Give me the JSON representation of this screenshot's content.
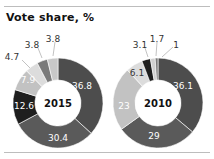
{
  "title": "Vote share, %",
  "charts": [
    {
      "label": "2015",
      "cx": 58,
      "cy": 103,
      "r_outer": 45,
      "r_inner": 23,
      "segments": [
        {
          "value": 36.8,
          "color": "#4d4d4d",
          "label": "36.8",
          "label_pos": [
            82,
            86
          ],
          "label_color": "#ffffff"
        },
        {
          "value": 30.4,
          "color": "#5a5a5a",
          "label": "30.4",
          "label_pos": [
            58,
            138
          ],
          "label_color": "#ffffff"
        },
        {
          "value": 12.6,
          "color": "#1e1e1e",
          "label": "12.6",
          "label_pos": [
            24,
            106
          ],
          "label_color": "#ffffff"
        },
        {
          "value": 7.9,
          "color": "#c2c2c2",
          "label": "7.9",
          "label_pos": [
            28,
            80
          ],
          "label_color": "#ffffff"
        },
        {
          "value": 4.7,
          "color": "#dcdcdc",
          "label": "4.7",
          "label_pos": [
            12,
            57
          ],
          "label_color": "#333333",
          "leader": [
            22,
            60,
            30,
            68
          ]
        },
        {
          "value": 3.8,
          "color": "#7a7a7a",
          "label": "3.8",
          "label_pos": [
            32,
            45
          ],
          "label_color": "#333333",
          "leader": [
            38,
            48,
            42,
            58
          ]
        },
        {
          "value": 3.8,
          "color": "#c8c8c8",
          "label": "3.8",
          "label_pos": [
            53,
            39
          ],
          "label_color": "#333333",
          "leader": [
            55,
            42,
            53,
            56
          ]
        }
      ]
    },
    {
      "label": "2010",
      "cx": 158,
      "cy": 103,
      "r_outer": 45,
      "r_inner": 23,
      "segments": [
        {
          "value": 36.1,
          "color": "#4d4d4d",
          "label": "36.1",
          "label_pos": [
            183,
            86
          ],
          "label_color": "#ffffff"
        },
        {
          "value": 29,
          "color": "#5a5a5a",
          "label": "29",
          "label_pos": [
            154,
            136
          ],
          "label_color": "#ffffff"
        },
        {
          "value": 23,
          "color": "#c2c2c2",
          "label": "23",
          "label_pos": [
            124,
            106
          ],
          "label_color": "#ffffff"
        },
        {
          "value": 6.1,
          "color": "#dcdcdc",
          "label": "6.1",
          "label_pos": [
            137,
            73
          ],
          "label_color": "#333333"
        },
        {
          "value": 3.1,
          "color": "#1e1e1e",
          "label": "3.1",
          "label_pos": [
            140,
            45
          ],
          "label_color": "#333333",
          "leader": [
            145,
            48,
            148,
            57
          ]
        },
        {
          "value": 1.7,
          "color": "#d0d0d0",
          "label": "1.7",
          "label_pos": [
            157,
            39
          ],
          "label_color": "#333333",
          "leader": [
            157,
            42,
            156,
            56
          ]
        },
        {
          "value": 1,
          "color": "#7a7a7a",
          "label": "1",
          "label_pos": [
            176,
            45
          ],
          "label_color": "#333333",
          "leader": [
            173,
            47,
            162,
            57
          ]
        }
      ]
    }
  ],
  "chart_data": {
    "type": "pie",
    "title": "Vote share, %",
    "charts": [
      {
        "label": "2015",
        "values": [
          36.8,
          30.4,
          12.6,
          7.9,
          4.7,
          3.8,
          3.8
        ]
      },
      {
        "label": "2010",
        "values": [
          36.1,
          29,
          23,
          6.1,
          3.1,
          1.7,
          1
        ]
      }
    ]
  }
}
